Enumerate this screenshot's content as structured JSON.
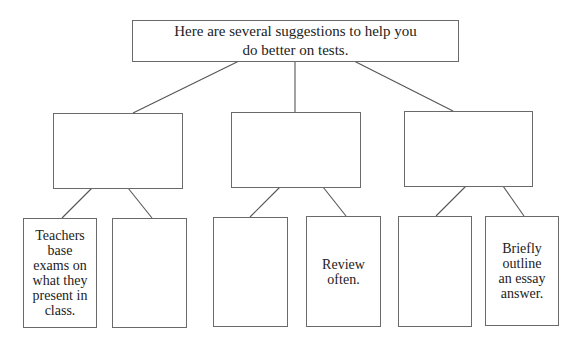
{
  "diagram": {
    "root": {
      "text": "Here are several suggestions to help you\ndo better on tests."
    },
    "categories": [
      {
        "text": "",
        "leaves": [
          {
            "text": "Teachers\nbase\nexams on\nwhat they\npresent in\nclass."
          },
          {
            "text": ""
          }
        ]
      },
      {
        "text": "",
        "leaves": [
          {
            "text": ""
          },
          {
            "text": "Review\noften."
          }
        ]
      },
      {
        "text": "",
        "leaves": [
          {
            "text": ""
          },
          {
            "text": "Briefly\noutline\nan essay\nanswer."
          }
        ]
      }
    ],
    "colors": {
      "line": "#555555",
      "border": "#6a6a6a",
      "text": "#222222"
    }
  }
}
